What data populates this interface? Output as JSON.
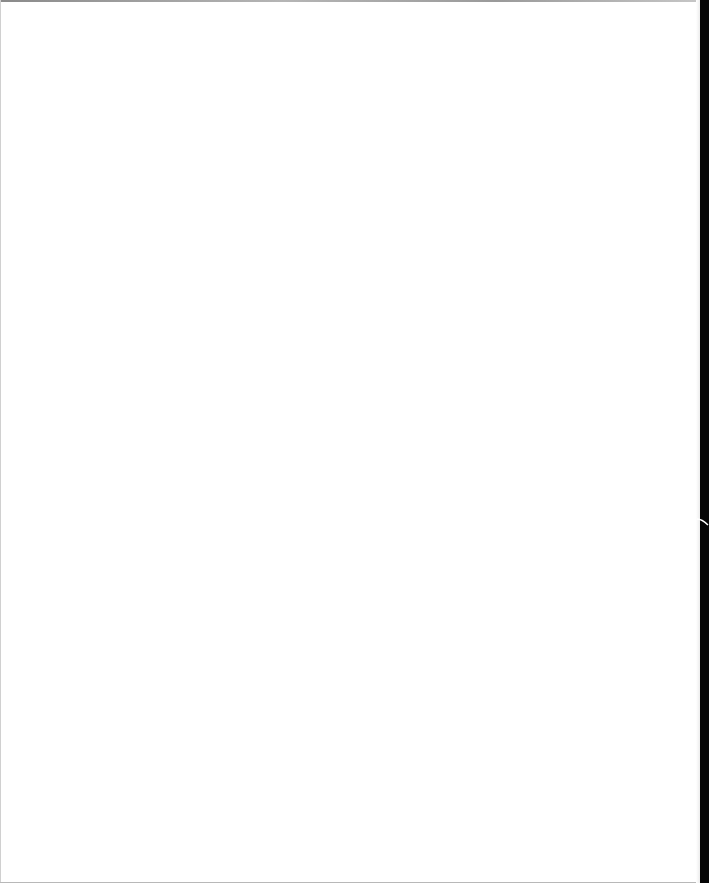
{
  "document": {
    "type": "blank scanned page",
    "content": ""
  },
  "colors": {
    "paper": "#ffffff",
    "scan_border": "#050505",
    "top_edge": "#9a9a9a"
  }
}
